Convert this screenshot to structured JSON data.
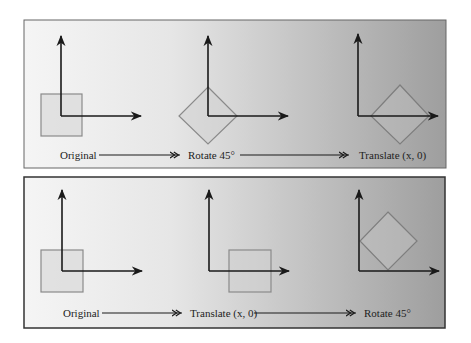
{
  "panels": [
    {
      "id": "rotate-then-translate",
      "steps": [
        {
          "label": "Original"
        },
        {
          "label": "Rotate 45°"
        },
        {
          "label": "Translate (x, 0)"
        }
      ]
    },
    {
      "id": "translate-then-rotate",
      "steps": [
        {
          "label": "Original"
        },
        {
          "label": "Translate (x, 0)"
        },
        {
          "label": "Rotate 45°"
        }
      ]
    }
  ],
  "colors": {
    "axis": "#1a1a1a",
    "shape_stroke": "#8a8a8a",
    "shape_fill": "#c8c8c8",
    "panel_light": "#f4f4f4",
    "panel_dark": "#9c9c9c",
    "border": "#444444"
  }
}
